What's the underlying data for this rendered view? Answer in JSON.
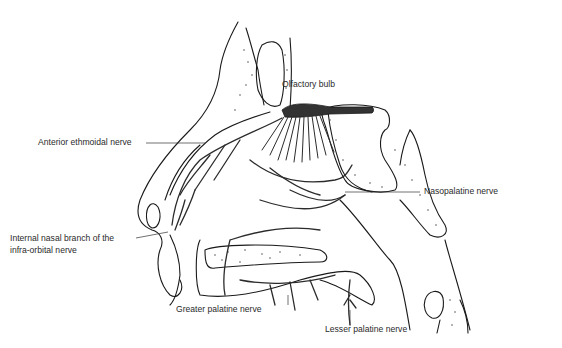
{
  "diagram": {
    "colors": {
      "line": "#1a1a1a",
      "nerve": "#2b2b2b",
      "bulb": "#333333",
      "bone_dots": "#555555",
      "background": "#ffffff"
    },
    "labels": {
      "olfactory_bulb": "Olfactory bulb",
      "anterior_ethmoidal": "Anterior ethmoidal nerve",
      "nasopalatine": "Nasopalatine nerve",
      "internal_nasal_line1": "Internal nasal branch of the",
      "internal_nasal_line2": "infra-orbital nerve",
      "greater_palatine": "Greater palatine nerve",
      "lesser_palatine": "Lesser palatine nerve"
    }
  }
}
